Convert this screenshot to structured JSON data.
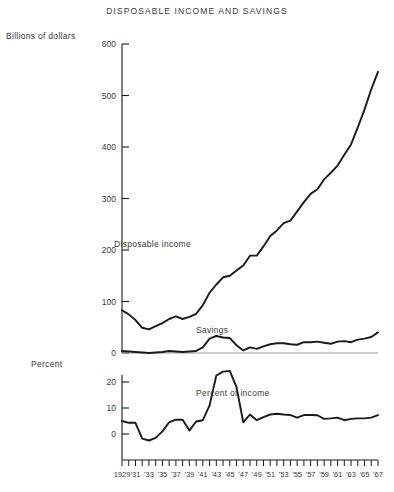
{
  "chart_data": {
    "type": "line",
    "title": "DISPOSABLE INCOME AND SAVINGS",
    "xlabel": "",
    "panels": [
      {
        "name": "upper",
        "ylabel": "Billions of dollars",
        "ylim": [
          0,
          600
        ],
        "yticks": [
          0,
          100,
          200,
          300,
          400,
          500,
          600
        ],
        "ytick_labels": [
          "0",
          "100",
          "200",
          "300",
          "400",
          "500",
          "600"
        ],
        "grid": false,
        "series": [
          {
            "name": "Disposable income",
            "label_text": "Disposable income",
            "x": [
              1929,
              1930,
              1931,
              1932,
              1933,
              1934,
              1935,
              1936,
              1937,
              1938,
              1939,
              1940,
              1941,
              1942,
              1943,
              1944,
              1945,
              1946,
              1947,
              1948,
              1949,
              1950,
              1951,
              1952,
              1953,
              1954,
              1955,
              1956,
              1957,
              1958,
              1959,
              1960,
              1961,
              1962,
              1963,
              1964,
              1965,
              1966,
              1967
            ],
            "values": [
              83,
              75,
              64,
              49,
              46,
              52,
              58,
              66,
              71,
              66,
              70,
              76,
              93,
              117,
              133,
              147,
              150,
              160,
              170,
              189,
              189,
              207,
              227,
              238,
              252,
              257,
              275,
              293,
              309,
              318,
              337,
              350,
              364,
              385,
              405,
              438,
              473,
              512,
              546
            ]
          },
          {
            "name": "Savings",
            "label_text": "Savings",
            "x": [
              1929,
              1930,
              1931,
              1932,
              1933,
              1934,
              1935,
              1936,
              1937,
              1938,
              1939,
              1940,
              1941,
              1942,
              1943,
              1944,
              1945,
              1946,
              1947,
              1948,
              1949,
              1950,
              1951,
              1952,
              1953,
              1954,
              1955,
              1956,
              1957,
              1958,
              1959,
              1960,
              1961,
              1962,
              1963,
              1964,
              1965,
              1966,
              1967
            ],
            "values": [
              4,
              3,
              2,
              1,
              0,
              1,
              2,
              4,
              3,
              2,
              3,
              4,
              11,
              28,
              33,
              30,
              29,
              15,
              5,
              11,
              8,
              13,
              17,
              19,
              19,
              17,
              16,
              21,
              21,
              22,
              20,
              18,
              22,
              23,
              21,
              26,
              28,
              31,
              40
            ]
          }
        ]
      },
      {
        "name": "lower",
        "ylabel": "Percent",
        "ylim": [
          -4,
          26
        ],
        "yticks": [
          0,
          10,
          20
        ],
        "ytick_labels": [
          "0",
          "10",
          "20"
        ],
        "grid": false,
        "series": [
          {
            "name": "Percent of income",
            "label_text": "Percent of income",
            "x": [
              1929,
              1930,
              1931,
              1932,
              1933,
              1934,
              1935,
              1936,
              1937,
              1938,
              1939,
              1940,
              1941,
              1942,
              1943,
              1944,
              1945,
              1946,
              1947,
              1948,
              1949,
              1950,
              1951,
              1952,
              1953,
              1954,
              1955,
              1956,
              1957,
              1958,
              1959,
              1960,
              1961,
              1962,
              1963,
              1964,
              1965,
              1966,
              1967
            ],
            "values": [
              5,
              4.3,
              4.3,
              -1.8,
              -2.5,
              -1.5,
              1,
              4.5,
              5.5,
              5.5,
              1.3,
              4.8,
              5.3,
              11,
              22.5,
              24,
              24.3,
              18,
              4.5,
              7.5,
              5.3,
              6.5,
              7.5,
              7.8,
              7.5,
              7.3,
              6.3,
              7.3,
              7.3,
              7.2,
              5.8,
              6,
              6.3,
              5.3,
              5.8,
              6,
              6,
              6.3,
              7.3
            ]
          }
        ]
      }
    ],
    "x_axis": {
      "min": 1929,
      "max": 1967,
      "tick_step": 1,
      "tick_labels": [
        {
          "year": 1929,
          "text": "1929"
        },
        {
          "year": 1931,
          "text": "'31"
        },
        {
          "year": 1933,
          "text": "'33"
        },
        {
          "year": 1935,
          "text": "'35"
        },
        {
          "year": 1937,
          "text": "'37"
        },
        {
          "year": 1939,
          "text": "'39"
        },
        {
          "year": 1941,
          "text": "'41"
        },
        {
          "year": 1943,
          "text": "'43"
        },
        {
          "year": 1945,
          "text": "'45"
        },
        {
          "year": 1947,
          "text": "'47"
        },
        {
          "year": 1949,
          "text": "'49"
        },
        {
          "year": 1951,
          "text": "'51"
        },
        {
          "year": 1953,
          "text": "'53"
        },
        {
          "year": 1955,
          "text": "'55"
        },
        {
          "year": 1957,
          "text": "'57"
        },
        {
          "year": 1959,
          "text": "'59"
        },
        {
          "year": 1961,
          "text": "'61"
        },
        {
          "year": 1963,
          "text": "'63"
        },
        {
          "year": 1965,
          "text": "'65"
        },
        {
          "year": 1967,
          "text": "'67"
        }
      ]
    },
    "colors": {
      "line": "#1a1a1a",
      "axis": "#1a1a1a",
      "text": "#3a3a3a",
      "background": "#ffffff"
    }
  }
}
